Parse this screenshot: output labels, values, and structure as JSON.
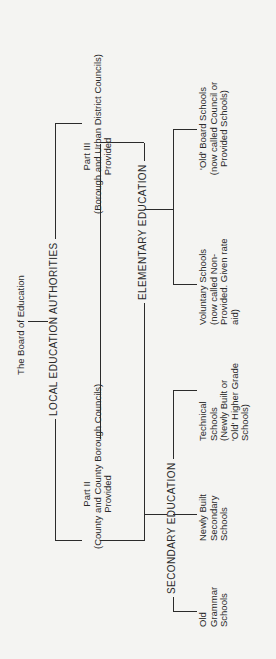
{
  "diagram": {
    "root": "The Board of Education",
    "authorities": "LOCAL EDUCATION AUTHORITIES",
    "part_iii": {
      "title": "Part III",
      "subtitle": "(Borough and Urban District Councils)",
      "provided": "Provided"
    },
    "part_ii": {
      "title": "Part II",
      "subtitle": "(County and County Borough Councils)",
      "provided": "Provided"
    },
    "elementary": {
      "label": "ELEMENTARY EDUCATION",
      "children": [
        {
          "lines": [
            "'Old' Board Schools",
            "(now called Council or",
            "Provided Schools)"
          ]
        },
        {
          "lines": [
            "Voluntary Schools",
            "(now called Non-",
            "Provided. Given rate",
            "aid)"
          ]
        }
      ]
    },
    "secondary": {
      "label": "SECONDARY EDUCATION",
      "children": [
        {
          "lines": [
            "Technical",
            "Schools",
            "(Newly Built or",
            "'Old' Higher Grade",
            "Schools)"
          ]
        },
        {
          "lines": [
            "Newly Built",
            "Secondary",
            "Schools"
          ]
        },
        {
          "lines": [
            "Old",
            "Grammar",
            "Schools"
          ]
        }
      ]
    }
  }
}
